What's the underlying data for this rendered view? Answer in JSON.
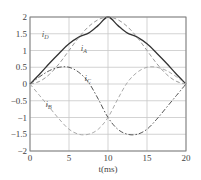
{
  "chart_data": {
    "type": "line",
    "title": "",
    "xlabel": "t(ms)",
    "ylabel": "",
    "xlim": [
      0,
      20
    ],
    "ylim": [
      -2,
      2
    ],
    "grid": true,
    "legend": "none (inline curve labels)",
    "x_ticks": [
      "0",
      "5",
      "10",
      "15",
      "20"
    ],
    "y_ticks": [
      "-2",
      "-1.5",
      "-1",
      "-0.5",
      "0",
      "0.5",
      "1",
      "1.5",
      "2"
    ],
    "x": [
      0,
      1.25,
      2.5,
      3.75,
      5,
      6.25,
      7.5,
      8.75,
      10,
      11.25,
      12.5,
      13.75,
      15,
      16.25,
      17.5,
      18.75,
      20
    ],
    "series": [
      {
        "name": "iD",
        "style": "solid",
        "color": "#333333",
        "values": [
          0,
          0.3,
          0.62,
          0.92,
          1.2,
          1.4,
          1.52,
          1.75,
          2.0,
          1.75,
          1.52,
          1.4,
          1.2,
          0.92,
          0.62,
          0.3,
          0
        ]
      },
      {
        "name": "iA",
        "style": "dashed",
        "color": "#999999",
        "values": [
          0,
          0.08,
          0.29,
          0.61,
          1.0,
          1.39,
          1.71,
          1.92,
          2.0,
          1.92,
          1.71,
          1.39,
          1.0,
          0.61,
          0.29,
          0.08,
          0
        ]
      },
      {
        "name": "iC",
        "style": "dash-dot",
        "color": "#555555",
        "values": [
          0,
          0.22,
          0.4,
          0.5,
          0.5,
          0.35,
          0.05,
          -0.45,
          -1.0,
          -1.35,
          -1.5,
          -1.5,
          -1.35,
          -1.05,
          -0.7,
          -0.35,
          0
        ]
      },
      {
        "name": "iB",
        "style": "dashed",
        "color": "#aaaaaa",
        "values": [
          0,
          -0.35,
          -0.7,
          -1.05,
          -1.35,
          -1.5,
          -1.5,
          -1.35,
          -1.0,
          -0.45,
          0.05,
          0.35,
          0.5,
          0.5,
          0.4,
          0.22,
          0
        ]
      }
    ],
    "annotations": [
      {
        "text": "iD",
        "x": 1.5,
        "y": 1.4
      },
      {
        "text": "iA",
        "x": 6.5,
        "y": 1.0
      },
      {
        "text": "iC",
        "x": 7.0,
        "y": 0.1
      },
      {
        "text": "iB",
        "x": 2.0,
        "y": -0.7
      }
    ]
  }
}
